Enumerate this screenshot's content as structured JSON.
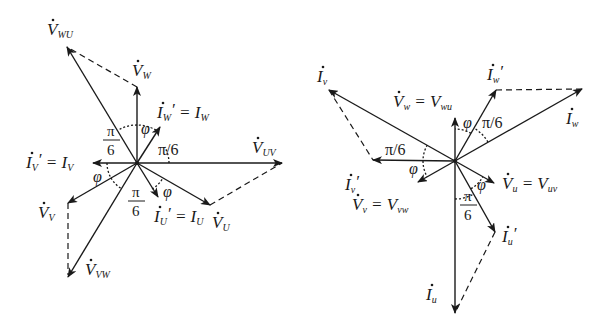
{
  "diagram": {
    "left": {
      "center": [
        137,
        163
      ],
      "vectors": [
        {
          "id": "V_WU",
          "label": "V",
          "sub": "WU",
          "end": [
            67,
            47
          ],
          "style": "solid",
          "lx": 47,
          "ly": 35
        },
        {
          "id": "V_W",
          "label": "V",
          "sub": "W",
          "end": [
            137,
            87
          ],
          "style": "solid",
          "lx": 132,
          "ly": 76
        },
        {
          "id": "I_W_prime",
          "label": "I",
          "sub": "W",
          "prime": true,
          "eq": "= I",
          "eqsub": "W",
          "end": [
            160,
            127
          ],
          "style": "solid",
          "lx": 157,
          "ly": 118
        },
        {
          "id": "I_V_prime",
          "label": "I",
          "sub": "V",
          "prime": true,
          "eq": "= I",
          "eqsub": "V",
          "end": [
            93,
            163
          ],
          "style": "solid",
          "lx": 26,
          "ly": 168
        },
        {
          "id": "V_UV",
          "label": "V",
          "sub": "UV",
          "end": [
            282,
            163
          ],
          "style": "solid",
          "lx": 252,
          "ly": 153
        },
        {
          "id": "V_U",
          "label": "V",
          "sub": "U",
          "end": [
            210,
            205
          ],
          "style": "solid",
          "lx": 212,
          "ly": 228
        },
        {
          "id": "I_U_prime",
          "label": "I",
          "sub": "U",
          "prime": true,
          "eq": "= I",
          "eqsub": "U",
          "end": [
            158,
            197
          ],
          "style": "solid",
          "lx": 154,
          "ly": 222
        },
        {
          "id": "V_V",
          "label": "V",
          "sub": "V",
          "end": [
            68,
            203
          ],
          "style": "solid",
          "lx": 38,
          "ly": 218
        },
        {
          "id": "V_VW",
          "label": "V",
          "sub": "VW",
          "end": [
            68,
            277
          ],
          "style": "solid",
          "lx": 85,
          "ly": 275
        }
      ],
      "dashed": [
        [
          [
            137,
            87
          ],
          [
            67,
            47
          ]
        ],
        [
          [
            210,
            205
          ],
          [
            282,
            163
          ]
        ],
        [
          [
            68,
            203
          ],
          [
            68,
            275
          ]
        ]
      ],
      "angles": [
        {
          "text": "π",
          "denom": "6",
          "x": 103,
          "y": 140
        },
        {
          "text": "φ",
          "x": 141,
          "y": 134
        },
        {
          "text": "π/6",
          "x": 158,
          "y": 155
        },
        {
          "text": "φ",
          "x": 93,
          "y": 182
        },
        {
          "text": "π",
          "denom": "6",
          "x": 128,
          "y": 201
        },
        {
          "text": "φ",
          "x": 163,
          "y": 197
        }
      ]
    },
    "right": {
      "center": [
        455,
        161
      ],
      "vectors": [
        {
          "id": "I_v",
          "label": "I",
          "sub": "v",
          "end": [
            329,
            90
          ],
          "style": "solid",
          "lx": 317,
          "ly": 82
        },
        {
          "id": "I_v_prime",
          "label": "I",
          "sub": "v",
          "prime": true,
          "end": [
            373,
            160
          ],
          "style": "solid",
          "lx": 345,
          "ly": 190
        },
        {
          "id": "V_w",
          "label": "V",
          "sub": "w",
          "eq": "= V",
          "eqsub": "wu",
          "end": [
            455,
            118
          ],
          "style": "solid",
          "lx": 393,
          "ly": 107
        },
        {
          "id": "I_w_prime",
          "label": "I",
          "sub": "w",
          "prime": true,
          "end": [
            496,
            90
          ],
          "style": "solid",
          "lx": 487,
          "ly": 80
        },
        {
          "id": "I_w",
          "label": "I",
          "sub": "w",
          "end": [
            582,
            89
          ],
          "style": "solid",
          "lx": 566,
          "ly": 124
        },
        {
          "id": "V_v",
          "label": "V",
          "sub": "v",
          "eq": "= V",
          "eqsub": "vw",
          "end": [
            418,
            182
          ],
          "style": "solid",
          "lx": 352,
          "ly": 210
        },
        {
          "id": "V_u",
          "label": "V",
          "sub": "u",
          "eq": "= V",
          "eqsub": "uv",
          "end": [
            494,
            183
          ],
          "style": "solid",
          "lx": 502,
          "ly": 189
        },
        {
          "id": "I_u_prime",
          "label": "I",
          "sub": "u",
          "prime": true,
          "end": [
            495,
            232
          ],
          "style": "solid",
          "lx": 502,
          "ly": 242
        },
        {
          "id": "I_u",
          "label": "I",
          "sub": "u",
          "end": [
            455,
            313
          ],
          "style": "solid",
          "lx": 426,
          "ly": 300
        }
      ],
      "dashed": [
        [
          [
            329,
            90
          ],
          [
            373,
            160
          ]
        ],
        [
          [
            496,
            90
          ],
          [
            582,
            89
          ]
        ],
        [
          [
            495,
            232
          ],
          [
            455,
            313
          ]
        ]
      ],
      "angles": [
        {
          "text": "φ",
          "x": 463,
          "y": 128
        },
        {
          "text": "π/6",
          "x": 482,
          "y": 128
        },
        {
          "text": "π/6",
          "x": 385,
          "y": 155
        },
        {
          "text": "φ",
          "x": 409,
          "y": 174
        },
        {
          "text": "φ",
          "x": 477,
          "y": 190
        },
        {
          "text": "π",
          "denom": "6",
          "x": 460,
          "y": 205
        }
      ]
    }
  }
}
